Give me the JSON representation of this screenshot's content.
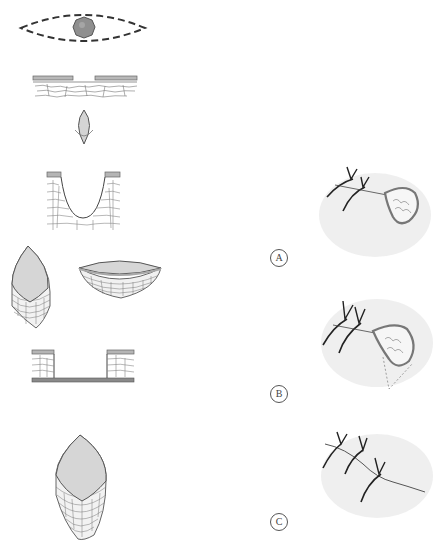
{
  "figure": {
    "colors": {
      "line": "#555555",
      "fill": "#d8d8d8",
      "lesion": "#8a8a8a",
      "epidermis": "#b5b5b5",
      "shadow": "#e6e6e6",
      "suture": "#222222"
    },
    "left_panels": [
      {
        "id": "1",
        "name": "lesion-with-elliptical-outline"
      },
      {
        "id": "2",
        "name": "skin-cross-section-with-lesion-gap"
      },
      {
        "id": "3",
        "name": "excised-ellipse-specimen-small"
      },
      {
        "id": "4",
        "name": "u-shaped-excision-cross-section"
      },
      {
        "id": "5a",
        "name": "excised-specimen-tall"
      },
      {
        "id": "5b",
        "name": "excised-specimen-bowl"
      },
      {
        "id": "6",
        "name": "full-thickness-excision-cross-section"
      },
      {
        "id": "7",
        "name": "excised-specimen-large"
      }
    ],
    "right_panels": [
      {
        "label": "A",
        "name": "suture-loop-around-tissue"
      },
      {
        "label": "B",
        "name": "suture-loop-with-undermining"
      },
      {
        "label": "C",
        "name": "completed-suture-closure"
      }
    ]
  }
}
